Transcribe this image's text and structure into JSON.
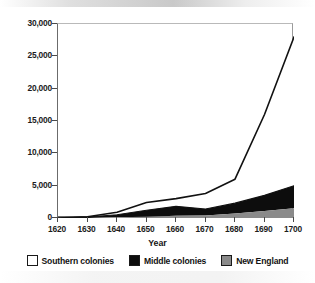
{
  "chart_data": {
    "type": "area",
    "stacked": true,
    "title": "",
    "xlabel": "Year",
    "ylabel": "",
    "x": [
      1620,
      1630,
      1640,
      1650,
      1660,
      1670,
      1680,
      1690,
      1700
    ],
    "xticklabels": [
      "1620",
      "1630",
      "1640",
      "1650",
      "1660",
      "1670",
      "1680",
      "1690",
      "1700"
    ],
    "xlim": [
      1620,
      1700
    ],
    "ylim": [
      0,
      30000
    ],
    "yticks": [
      0,
      5000,
      10000,
      15000,
      20000,
      25000,
      30000
    ],
    "yticklabels": [
      "0",
      "5,000",
      "10,000",
      "15,000",
      "20,000",
      "25,000",
      "30,000"
    ],
    "grid": false,
    "legend_position": "bottom",
    "series": [
      {
        "name": "New England",
        "color": "#8a8a8a",
        "stack_order": 1,
        "values": [
          0,
          0,
          100,
          200,
          350,
          400,
          700,
          1100,
          1500
        ]
      },
      {
        "name": "Middle colonies",
        "color": "#0d0d0d",
        "stack_order": 2,
        "values": [
          0,
          150,
          400,
          1000,
          1450,
          1000,
          1600,
          2400,
          3500
        ]
      },
      {
        "name": "Southern colonies",
        "color": "#ffffff",
        "stack_order": 3,
        "values": [
          0,
          50,
          400,
          1200,
          1200,
          2400,
          3700,
          12500,
          23000
        ]
      }
    ],
    "totals": [
      0,
      200,
      900,
      2400,
      3000,
      3800,
      6000,
      16000,
      28000
    ],
    "annotations": []
  },
  "legend": {
    "items": [
      {
        "label": "Southern colonies",
        "color": "#ffffff"
      },
      {
        "label": "Middle colonies",
        "color": "#0d0d0d"
      },
      {
        "label": "New England",
        "color": "#8a8a8a"
      }
    ]
  }
}
